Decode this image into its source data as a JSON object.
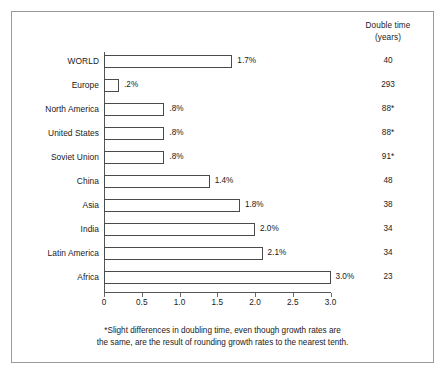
{
  "right_column": {
    "header_line1": "Double time",
    "header_line2": "(years)"
  },
  "footnote": {
    "line1": "*Slight differences in doubling time, even though growth rates are",
    "line2": "the same, are the result of rounding growth rates to the nearest tenth."
  },
  "chart_data": {
    "type": "bar",
    "orientation": "horizontal",
    "title": "",
    "xlabel": "",
    "ylabel": "",
    "xlim": [
      0,
      3.0
    ],
    "grid": false,
    "legend": null,
    "tick_labels": [
      "0",
      "0.5",
      "1.0",
      "1.5",
      "2.0",
      "2.5",
      "3.0"
    ],
    "tick_values": [
      0,
      0.5,
      1.0,
      1.5,
      2.0,
      2.5,
      3.0
    ],
    "categories": [
      "WORLD",
      "Europe",
      "North America",
      "United States",
      "Soviet Union",
      "China",
      "Asia",
      "India",
      "Latin America",
      "Africa"
    ],
    "values": [
      1.7,
      0.2,
      0.8,
      0.8,
      0.8,
      1.4,
      1.8,
      2.0,
      2.1,
      3.0
    ],
    "value_labels": [
      "1.7%",
      ".2%",
      ".8%",
      ".8%",
      ".8%",
      "1.4%",
      "1.8%",
      "2.0%",
      "2.1%",
      "3.0%"
    ],
    "double_time": [
      "40",
      "293",
      "88*",
      "88*",
      "91*",
      "48",
      "38",
      "34",
      "34",
      "23"
    ],
    "colors": {
      "bar_fill": "#ffffff",
      "bar_stroke": "#4a4a4a",
      "axis": "#555555",
      "text": "#1a1a1a",
      "frame": "#9a9a9a"
    }
  }
}
